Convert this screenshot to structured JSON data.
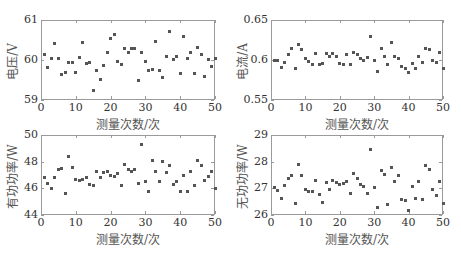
{
  "chart_data": [
    {
      "type": "scatter",
      "title": "",
      "xlabel": "测量次数/次",
      "ylabel": "电压/V",
      "xlim": [
        0,
        50
      ],
      "ylim": [
        59,
        61
      ],
      "xticks": [
        "0",
        "10",
        "20",
        "30",
        "40",
        "50"
      ],
      "yticks": [
        "59",
        "60",
        "61"
      ],
      "grid": false,
      "x": [
        1,
        2,
        3,
        4,
        5,
        6,
        7,
        8,
        9,
        10,
        11,
        12,
        13,
        14,
        15,
        16,
        17,
        18,
        19,
        20,
        21,
        22,
        23,
        24,
        25,
        26,
        27,
        28,
        29,
        30,
        31,
        32,
        33,
        34,
        35,
        36,
        37,
        38,
        39,
        40,
        41,
        42,
        43,
        44,
        45,
        46,
        47,
        48,
        49,
        50
      ],
      "values": [
        60.15,
        59.82,
        60.05,
        60.42,
        60.05,
        59.63,
        59.68,
        59.93,
        59.93,
        59.69,
        60.07,
        60.45,
        59.91,
        59.93,
        59.23,
        59.73,
        59.52,
        59.86,
        60.19,
        60.55,
        60.64,
        59.96,
        59.89,
        60.3,
        60.18,
        60.28,
        60.28,
        59.49,
        60.2,
        59.97,
        59.74,
        59.76,
        60.46,
        59.73,
        59.57,
        60.08,
        60.71,
        60.01,
        60.1,
        59.67,
        60.59,
        60.04,
        60.19,
        59.67,
        60.31,
        60.13,
        59.6,
        60.02,
        59.84,
        60.05
      ]
    },
    {
      "type": "scatter",
      "title": "",
      "xlabel": "测量次数/次",
      "ylabel": "电流/A",
      "xlim": [
        0,
        50
      ],
      "ylim": [
        0.55,
        0.65
      ],
      "xticks": [
        "0",
        "10",
        "20",
        "30",
        "40",
        "50"
      ],
      "yticks": [
        "0.55",
        "0.6",
        "0.65"
      ],
      "grid": false,
      "x": [
        1,
        2,
        3,
        4,
        5,
        6,
        7,
        8,
        9,
        10,
        11,
        12,
        13,
        14,
        15,
        16,
        17,
        18,
        19,
        20,
        21,
        22,
        23,
        24,
        25,
        26,
        27,
        28,
        29,
        30,
        31,
        32,
        33,
        34,
        35,
        36,
        37,
        38,
        39,
        40,
        41,
        42,
        43,
        44,
        45,
        46,
        47,
        48,
        49,
        50
      ],
      "values": [
        0.599,
        0.599,
        0.591,
        0.597,
        0.607,
        0.615,
        0.59,
        0.62,
        0.613,
        0.602,
        0.598,
        0.594,
        0.608,
        0.594,
        0.596,
        0.608,
        0.604,
        0.608,
        0.604,
        0.596,
        0.595,
        0.607,
        0.594,
        0.61,
        0.607,
        0.602,
        0.6,
        0.603,
        0.63,
        0.599,
        0.586,
        0.615,
        0.605,
        0.594,
        0.622,
        0.604,
        0.602,
        0.592,
        0.59,
        0.584,
        0.596,
        0.59,
        0.605,
        0.597,
        0.615,
        0.613,
        0.6,
        0.597,
        0.609,
        0.589
      ]
    },
    {
      "type": "scatter",
      "title": "",
      "xlabel": "测量次数/次",
      "ylabel": "有功功率/W",
      "xlim": [
        0,
        50
      ],
      "ylim": [
        44,
        50
      ],
      "xticks": [
        "0",
        "10",
        "20",
        "30",
        "40",
        "50"
      ],
      "yticks": [
        "44",
        "46",
        "48",
        "50"
      ],
      "grid": false,
      "x": [
        1,
        2,
        3,
        4,
        5,
        6,
        7,
        8,
        9,
        10,
        11,
        12,
        13,
        14,
        15,
        16,
        17,
        18,
        19,
        20,
        21,
        22,
        23,
        24,
        25,
        26,
        27,
        28,
        29,
        30,
        31,
        32,
        33,
        34,
        35,
        36,
        37,
        38,
        39,
        40,
        41,
        42,
        43,
        44,
        45,
        46,
        47,
        48,
        49,
        50
      ],
      "values": [
        46.8,
        46.4,
        46.0,
        46.8,
        47.4,
        47.5,
        45.6,
        48.4,
        47.6,
        46.7,
        46.6,
        46.7,
        46.8,
        46.3,
        46.2,
        47.3,
        46.8,
        47.2,
        47.3,
        47.0,
        46.9,
        47.1,
        46.2,
        47.8,
        47.4,
        47.3,
        47.4,
        46.4,
        49.3,
        46.5,
        45.8,
        48.1,
        47.3,
        46.5,
        48.0,
        47.2,
        47.7,
        46.3,
        46.5,
        45.8,
        47.0,
        45.8,
        47.3,
        46.2,
        48.1,
        47.7,
        46.6,
        46.9,
        47.3,
        46.0
      ]
    },
    {
      "type": "scatter",
      "title": "",
      "xlabel": "测量次数/次",
      "ylabel": "无功功率/W",
      "xlim": [
        0,
        50
      ],
      "ylim": [
        26,
        29
      ],
      "xticks": [
        "0",
        "10",
        "20",
        "30",
        "40",
        "50"
      ],
      "yticks": [
        "26",
        "27",
        "28",
        "29"
      ],
      "grid": false,
      "x": [
        1,
        2,
        3,
        4,
        5,
        6,
        7,
        8,
        9,
        10,
        11,
        12,
        13,
        14,
        15,
        16,
        17,
        18,
        19,
        20,
        21,
        22,
        23,
        24,
        25,
        26,
        27,
        28,
        29,
        30,
        31,
        32,
        33,
        34,
        35,
        36,
        37,
        38,
        39,
        40,
        41,
        42,
        43,
        44,
        45,
        46,
        47,
        48,
        49,
        50
      ],
      "values": [
        27.05,
        26.92,
        26.63,
        27.12,
        27.37,
        27.47,
        26.42,
        27.88,
        27.48,
        26.97,
        26.9,
        26.9,
        27.3,
        26.76,
        26.48,
        27.22,
        26.95,
        27.28,
        27.21,
        27.14,
        27.19,
        27.24,
        26.81,
        27.57,
        27.36,
        27.13,
        27.06,
        26.82,
        28.47,
        27.04,
        26.3,
        27.68,
        27.51,
        26.4,
        27.78,
        27.24,
        27.47,
        26.58,
        26.55,
        26.18,
        27.07,
        26.62,
        27.25,
        26.58,
        27.86,
        27.7,
        26.97,
        26.75,
        27.26,
        26.45
      ]
    }
  ],
  "panels": [
    {
      "ylabel": "电压/V",
      "xlabel": "测量次数/次"
    },
    {
      "ylabel": "电流/A",
      "xlabel": "测量次数/次"
    },
    {
      "ylabel": "有功功率/W",
      "xlabel": "测量次数/次"
    },
    {
      "ylabel": "无功功率/W",
      "xlabel": "测量次数/次"
    }
  ],
  "colors": {
    "marker": "#555555",
    "frame": "#9a9a9a",
    "text": "#333333"
  }
}
